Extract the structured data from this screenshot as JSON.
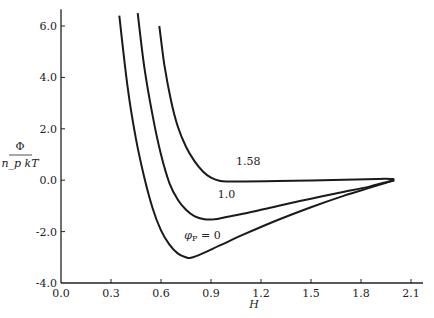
{
  "chart_data": {
    "type": "line",
    "title": "",
    "xlabel": "H",
    "ylabel": "Φ / (n_p kT)",
    "ylabel_numerator": "Φ",
    "ylabel_denominator": "n_p kT",
    "xlim": [
      0.0,
      2.1
    ],
    "ylim": [
      -4.0,
      6.5
    ],
    "xticks": [
      "0.0",
      "0.3",
      "0.6",
      "0.9",
      "1.2",
      "1.5",
      "1.8",
      "2.1"
    ],
    "xtick_values": [
      0.0,
      0.3,
      0.6,
      0.9,
      1.2,
      1.5,
      1.8,
      2.1
    ],
    "yticks": [
      "6.0",
      "4.0",
      "2.0",
      "0.0",
      "-2.0",
      "-4.0"
    ],
    "ytick_values": [
      6.0,
      4.0,
      2.0,
      0.0,
      -2.0,
      -4.0
    ],
    "grid": false,
    "legend": "none",
    "series": [
      {
        "name": "φp = 0",
        "label": "φp = 0",
        "x": [
          0.35,
          0.4,
          0.45,
          0.5,
          0.55,
          0.6,
          0.65,
          0.7,
          0.75,
          0.78,
          0.85,
          0.95,
          1.1,
          1.3,
          1.5,
          1.7,
          1.85,
          1.95,
          2.0
        ],
        "y": [
          6.4,
          3.6,
          1.6,
          0.1,
          -1.1,
          -1.95,
          -2.5,
          -2.85,
          -3.0,
          -3.02,
          -2.85,
          -2.55,
          -2.1,
          -1.55,
          -1.05,
          -0.6,
          -0.3,
          -0.1,
          0.0
        ]
      },
      {
        "name": "1.0",
        "label": "1.0",
        "x": [
          0.46,
          0.5,
          0.55,
          0.6,
          0.65,
          0.7,
          0.75,
          0.8,
          0.86,
          0.92,
          1.0,
          1.1,
          1.3,
          1.5,
          1.7,
          1.85,
          1.95,
          2.0
        ],
        "y": [
          6.5,
          4.4,
          2.5,
          1.0,
          -0.1,
          -0.75,
          -1.15,
          -1.4,
          -1.52,
          -1.52,
          -1.42,
          -1.3,
          -1.0,
          -0.72,
          -0.45,
          -0.25,
          -0.08,
          0.0
        ]
      },
      {
        "name": "1.58",
        "label": "1.58",
        "x": [
          0.59,
          0.62,
          0.66,
          0.7,
          0.75,
          0.8,
          0.85,
          0.9,
          0.95,
          1.0,
          1.05,
          1.1,
          1.3,
          1.5,
          1.7,
          1.9,
          2.0
        ],
        "y": [
          6.0,
          4.5,
          3.1,
          2.1,
          1.3,
          0.75,
          0.35,
          0.1,
          -0.02,
          -0.05,
          -0.05,
          -0.05,
          -0.03,
          -0.01,
          0.02,
          0.05,
          0.05
        ]
      }
    ],
    "annotations": [
      {
        "text": "1.58",
        "x": 1.05,
        "y": 0.6
      },
      {
        "text": "1.0",
        "x": 0.94,
        "y": -0.7
      },
      {
        "text": "φp = 0",
        "x": 0.74,
        "y": -2.3
      }
    ]
  }
}
